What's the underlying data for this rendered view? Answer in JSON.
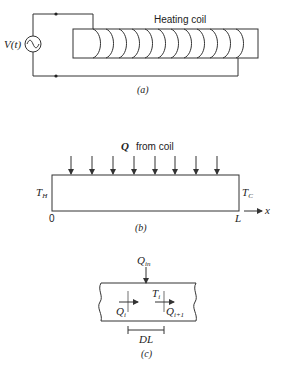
{
  "figure_a": {
    "source_label": "V(t)",
    "coil_label": "Heating coil",
    "caption": "(a)",
    "coil_turns": 12
  },
  "figure_b": {
    "heat_label_symbol": "Q",
    "heat_label_text": "from coil",
    "left_temp": "T",
    "left_temp_sub": "H",
    "right_temp": "T",
    "right_temp_sub": "C",
    "origin_label": "0",
    "length_label": "L",
    "axis_label": "x",
    "caption": "(b)",
    "arrow_count": 8
  },
  "figure_c": {
    "input_symbol": "Q",
    "input_sub": "in",
    "node_temp": "T",
    "node_temp_sub": "i",
    "flux_in": "Q",
    "flux_in_sub": "i",
    "flux_out": "Q",
    "flux_out_sub": "i+1",
    "segment_label": "DL",
    "caption": "(c)"
  }
}
